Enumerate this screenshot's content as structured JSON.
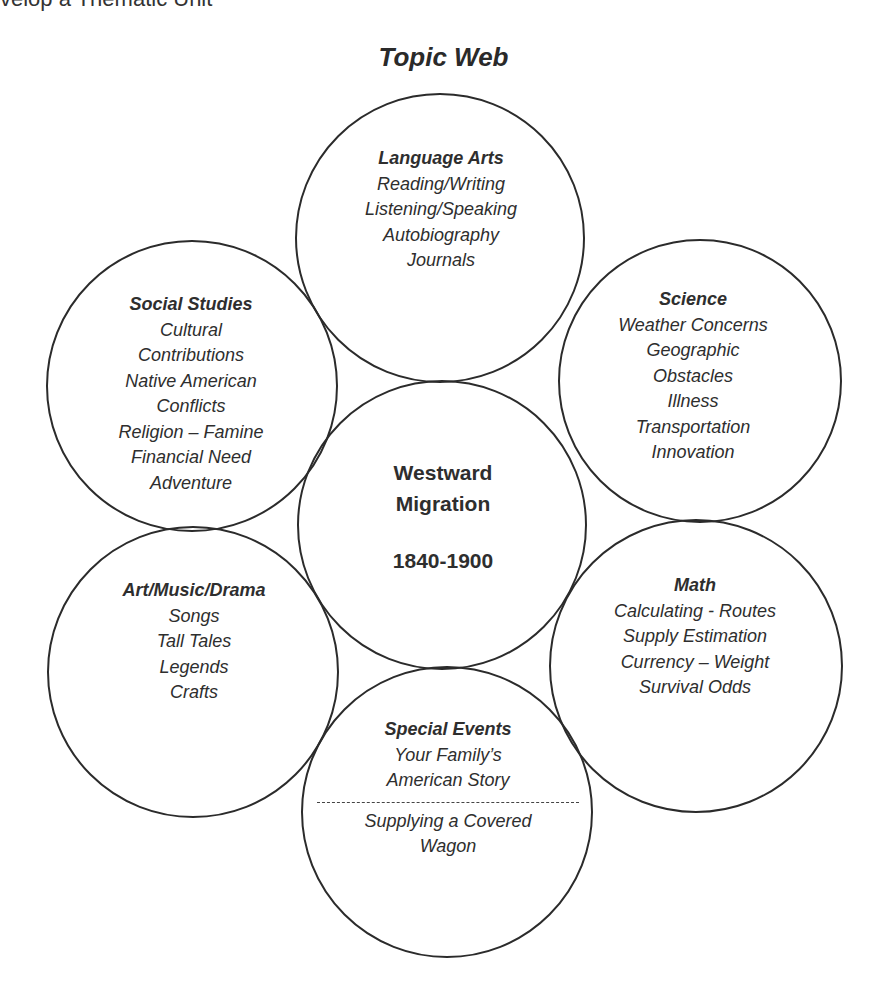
{
  "header": {
    "cut_off_text": "velop a Thematic Unit"
  },
  "title": "Topic Web",
  "center": {
    "line1": "Westward",
    "line2": "Migration",
    "years": "1840-1900"
  },
  "nodes": {
    "language_arts": {
      "heading": "Language Arts",
      "items": [
        "Reading/Writing",
        "Listening/Speaking",
        "Autobiography",
        "Journals"
      ]
    },
    "social_studies": {
      "heading": "Social Studies",
      "items": [
        "Cultural",
        "Contributions",
        "Native American",
        "Conflicts",
        "Religion – Famine",
        "Financial Need",
        "Adventure"
      ]
    },
    "science": {
      "heading": "Science",
      "items": [
        "Weather Concerns",
        "Geographic",
        "Obstacles",
        "Illness",
        "Transportation",
        "Innovation"
      ]
    },
    "art_music_drama": {
      "heading": "Art/Music/Drama",
      "items": [
        "Songs",
        "Tall Tales",
        "Legends",
        "Crafts"
      ]
    },
    "math": {
      "heading": "Math",
      "items": [
        "Calculating - Routes",
        "Supply Estimation",
        "Currency – Weight",
        "Survival Odds"
      ]
    },
    "special_events": {
      "heading": "Special Events",
      "items_top": [
        "Your Family’s",
        "American Story"
      ],
      "items_bottom": [
        "Supplying a Covered",
        "Wagon"
      ]
    }
  },
  "colors": {
    "stroke": "#2b2b2b",
    "text": "#2e2e2e",
    "background": "#ffffff"
  }
}
